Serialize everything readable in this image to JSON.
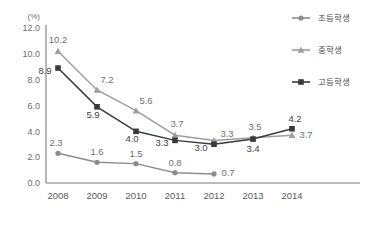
{
  "chart_data": {
    "type": "line",
    "title": "",
    "subtitle": "",
    "xlabel": "",
    "ylabel": "(%)",
    "ylim": [
      0.0,
      12.0
    ],
    "ytick_step": 2.0,
    "yticks": [
      "0.0",
      "2.0",
      "4.0",
      "6.0",
      "8.0",
      "10.0",
      "12.0"
    ],
    "categories": [
      "2008",
      "2009",
      "2010",
      "2011",
      "2012",
      "2013",
      "2014"
    ],
    "x": [
      2008,
      2009,
      2010,
      2011,
      2012,
      2013,
      2014
    ],
    "grid": false,
    "legend_position": "top-right",
    "series": [
      {
        "name": "초등학생",
        "marker": "circle",
        "color": "#8c8c8c",
        "values": [
          2.3,
          1.6,
          1.5,
          0.8,
          0.7,
          null,
          null
        ],
        "labels": [
          "2.3",
          "1.6",
          "1.5",
          "0.8",
          "0.7",
          "",
          ""
        ]
      },
      {
        "name": "중학생",
        "marker": "triangle",
        "color": "#9e9e9e",
        "values": [
          10.2,
          7.2,
          5.6,
          3.7,
          3.3,
          3.5,
          3.7
        ],
        "labels": [
          "10.2",
          "7.2",
          "5.6",
          "3.7",
          "3.3",
          "3.5",
          "3.7"
        ]
      },
      {
        "name": "고등학생",
        "marker": "square",
        "color": "#3a3a3a",
        "values": [
          8.9,
          5.9,
          4.0,
          3.3,
          3.0,
          3.4,
          4.2
        ],
        "labels": [
          "8.9",
          "5.9",
          "4.0",
          "3.3",
          "3.0",
          "3.4",
          "4.2"
        ]
      }
    ]
  },
  "legend": {
    "items": [
      {
        "label": "초등학생",
        "marker": "circle",
        "color": "#8c8c8c"
      },
      {
        "label": "중학생",
        "marker": "triangle",
        "color": "#9e9e9e"
      },
      {
        "label": "고등학생",
        "marker": "square",
        "color": "#3a3a3a"
      }
    ]
  },
  "colors": {
    "axis": "#7a7a7a",
    "tick_text": "#6b6b6b",
    "background": "#ffffff",
    "elementary": "#8c8c8c",
    "middle": "#9e9e9e",
    "high": "#3a3a3a"
  }
}
